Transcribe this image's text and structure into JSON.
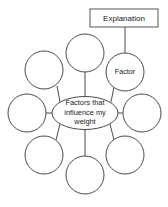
{
  "diagram": {
    "type": "spider-web-concept-map",
    "center": {
      "label_line1": "Factors that",
      "label_line2": "influence my",
      "label_line3": "weight",
      "full_label": "Factors that influence my weight",
      "shape": "ellipse",
      "cx": 85,
      "cy": 113,
      "rx": 33,
      "ry": 16.5
    },
    "callout_box": {
      "label": "Explanation",
      "x": 90,
      "y": 9,
      "width": 68,
      "height": 18
    },
    "nodes": [
      {
        "id": "node-top",
        "label": "",
        "cx": 85,
        "cy": 53,
        "r": 19
      },
      {
        "id": "node-top-right",
        "label": "Factor",
        "cx": 125,
        "cy": 72,
        "r": 19
      },
      {
        "id": "node-right",
        "label": "",
        "cx": 142,
        "cy": 113,
        "r": 19
      },
      {
        "id": "node-bottom-right",
        "label": "",
        "cx": 125,
        "cy": 155,
        "r": 19
      },
      {
        "id": "node-bottom",
        "label": "",
        "cx": 85,
        "cy": 175,
        "r": 19
      },
      {
        "id": "node-bottom-left",
        "label": "",
        "cx": 44,
        "cy": 155,
        "r": 19
      },
      {
        "id": "node-left",
        "label": "",
        "cx": 27,
        "cy": 113,
        "r": 19
      },
      {
        "id": "node-top-left",
        "label": "",
        "cx": 44,
        "cy": 70,
        "r": 19
      }
    ],
    "colors": {
      "stroke": "#4a4a4a",
      "fill": "#ffffff",
      "text": "#1a1a1a",
      "background": "#ffffff"
    }
  }
}
